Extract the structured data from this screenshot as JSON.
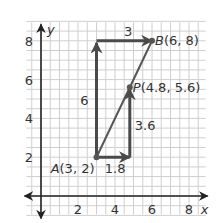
{
  "diagram": {
    "type": "coordinate-plane",
    "x_axis": {
      "label": "x",
      "range": [
        -1,
        8.9
      ],
      "ticks": [
        2,
        4,
        6,
        8
      ],
      "tick_labels": [
        "2",
        "4",
        "6",
        "8"
      ]
    },
    "y_axis": {
      "label": "y",
      "range": [
        -0.9,
        9
      ],
      "ticks": [
        2,
        4,
        6,
        8
      ],
      "tick_labels": [
        "2",
        "4",
        "6",
        "8"
      ]
    },
    "grid": true,
    "grid_step": 1,
    "points": [
      {
        "id": "A",
        "x": 3,
        "y": 2,
        "label": "A(3, 2)",
        "name": "A",
        "coords": "(3, 2)"
      },
      {
        "id": "B",
        "x": 6,
        "y": 8,
        "label": "B(6, 8)",
        "name": "B",
        "coords": "(6, 8)"
      },
      {
        "id": "P",
        "x": 4.8,
        "y": 5.6,
        "label": "P(4.8, 5.6)",
        "name": "P",
        "coords": "(4.8, 5.6)"
      }
    ],
    "segment": {
      "from": "A",
      "to": "B"
    },
    "vectors": [
      {
        "id": "rise-AB",
        "from": [
          3,
          2
        ],
        "to": [
          3,
          8
        ],
        "label": "6"
      },
      {
        "id": "run-AB",
        "from": [
          3,
          8
        ],
        "to": [
          6,
          8
        ],
        "label": "3"
      },
      {
        "id": "run-AP",
        "from": [
          3,
          2
        ],
        "to": [
          4.8,
          2
        ],
        "label": "1.8"
      },
      {
        "id": "rise-AP",
        "from": [
          4.8,
          2
        ],
        "to": [
          4.8,
          5.6
        ],
        "label": "3.6"
      }
    ]
  }
}
